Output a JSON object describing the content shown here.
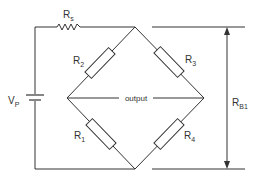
{
  "diagram": {
    "type": "wheatstone-bridge-circuit",
    "colors": {
      "line": "#333333",
      "background": "#ffffff"
    },
    "labels": {
      "rs": {
        "main": "R",
        "sub": "s"
      },
      "r1": {
        "main": "R",
        "sub": "1"
      },
      "r2": {
        "main": "R",
        "sub": "2"
      },
      "r3": {
        "main": "R",
        "sub": "3"
      },
      "r4": {
        "main": "R",
        "sub": "4"
      },
      "vp": {
        "main": "V",
        "sub": "P"
      },
      "rb1": {
        "main": "R",
        "sub": "B1"
      },
      "output": "output"
    },
    "components": [
      {
        "id": "Rs",
        "kind": "zigzag-resistor",
        "position": "top-left series"
      },
      {
        "id": "R2",
        "kind": "box-resistor",
        "position": "upper-left arm"
      },
      {
        "id": "R3",
        "kind": "box-resistor",
        "position": "upper-right arm"
      },
      {
        "id": "R1",
        "kind": "box-resistor",
        "position": "lower-left arm"
      },
      {
        "id": "R4",
        "kind": "box-resistor",
        "position": "lower-right arm"
      },
      {
        "id": "Vp",
        "kind": "battery",
        "position": "left supply"
      },
      {
        "id": "RB1",
        "kind": "dimension-arrow",
        "position": "right, spanning bridge"
      }
    ]
  }
}
